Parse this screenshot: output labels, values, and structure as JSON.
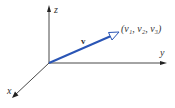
{
  "diagram": {
    "type": "3d-coordinate-vector",
    "axes": {
      "x_label": "x",
      "y_label": "y",
      "z_label": "z"
    },
    "vector": {
      "label": "v",
      "endpoint_label": "(v₁, v₂, v₃)",
      "color": "#2a55b5"
    },
    "axis_color": "#333333"
  }
}
